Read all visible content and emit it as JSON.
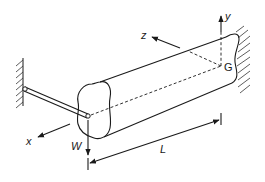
{
  "diagram": {
    "type": "cantilever-beam-with-torsion-rod",
    "labels": {
      "x_axis": "x",
      "y_axis": "y",
      "z_axis": "z",
      "load": "W",
      "length": "L",
      "centroid": "G"
    },
    "colors": {
      "line": "#1a1a1a",
      "background": "#ffffff"
    }
  }
}
